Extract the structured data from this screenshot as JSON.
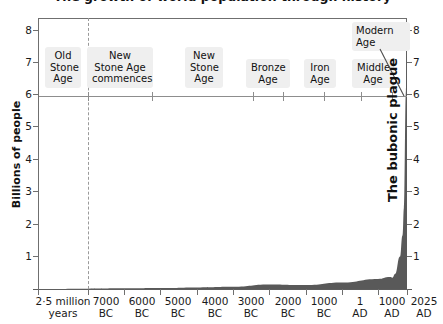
{
  "chart_data": {
    "type": "area",
    "title": "The growth of world population through history",
    "xlabel": "",
    "ylabel": "Billions of people",
    "ylim": [
      0,
      8.6
    ],
    "grid": false,
    "legend": "none",
    "y_ticks": [
      "1",
      "2",
      "3",
      "4",
      "5",
      "6",
      "7",
      "8"
    ],
    "y_ticks_right": [
      "1",
      "2",
      "3",
      "4",
      "5",
      "6",
      "7",
      "8"
    ],
    "x_ticks": [
      {
        "l1": "2·5 million",
        "l2": "years"
      },
      {
        "l1": "7000",
        "l2": "BC"
      },
      {
        "l1": "6000",
        "l2": "BC"
      },
      {
        "l1": "5000",
        "l2": "BC"
      },
      {
        "l1": "4000",
        "l2": "BC"
      },
      {
        "l1": "3000",
        "l2": "BC"
      },
      {
        "l1": "2000",
        "l2": "BC"
      },
      {
        "l1": "1000",
        "l2": "BC"
      },
      {
        "l1": "1",
        "l2": "AD"
      },
      {
        "l1": "1000",
        "l2": "AD"
      },
      {
        "l1": "2025",
        "l2": "AD"
      }
    ],
    "eras": [
      {
        "lines": [
          "Old",
          "Stone",
          "Age"
        ]
      },
      {
        "lines": [
          "New",
          "Stone Age",
          "commences"
        ]
      },
      {
        "lines": [
          "New",
          "Stone",
          "Age"
        ]
      },
      {
        "lines": [
          "Bronze",
          "Age"
        ]
      },
      {
        "lines": [
          "Iron",
          "Age"
        ]
      },
      {
        "lines": [
          "Middle",
          "Age"
        ]
      }
    ],
    "modern_age": {
      "lines": [
        "Modern",
        "Age"
      ]
    },
    "annotation": "The bubonic plague",
    "series": [
      {
        "name": "World population",
        "points": [
          {
            "x": "2.5 million years",
            "y": 0.0
          },
          {
            "x": "7000 BC",
            "y": 0.01
          },
          {
            "x": "6000 BC",
            "y": 0.02
          },
          {
            "x": "5000 BC",
            "y": 0.03
          },
          {
            "x": "4000 BC",
            "y": 0.05
          },
          {
            "x": "3000 BC",
            "y": 0.07
          },
          {
            "x": "2000 BC",
            "y": 0.14
          },
          {
            "x": "1000 BC",
            "y": 0.12
          },
          {
            "x": "1 AD",
            "y": 0.2
          },
          {
            "x": "1000 AD",
            "y": 0.31
          },
          {
            "x": "1350 AD",
            "y": 0.37
          },
          {
            "x": "1400 AD",
            "y": 0.35
          },
          {
            "x": "1500 AD",
            "y": 0.46
          },
          {
            "x": "1800 AD",
            "y": 1.0
          },
          {
            "x": "1900 AD",
            "y": 1.65
          },
          {
            "x": "1950 AD",
            "y": 2.5
          },
          {
            "x": "2000 AD",
            "y": 6.1
          },
          {
            "x": "2025 AD",
            "y": 8.2
          }
        ]
      }
    ],
    "colors": {
      "area_fill": "#595959",
      "axis": "#6f6f6f",
      "era_rule": "#8d8d8d",
      "label_bg": "#efefef",
      "text": "#111111"
    }
  }
}
